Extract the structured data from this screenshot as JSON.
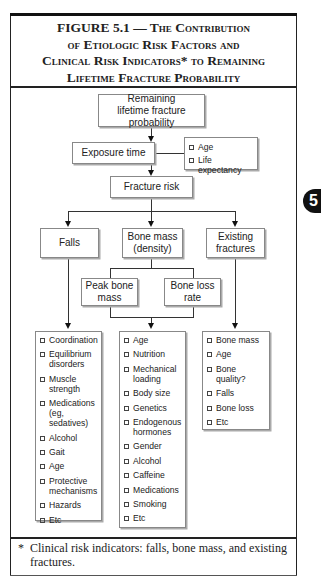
{
  "figure": {
    "title_lines": [
      "FIGURE 5.1 — The Contribution",
      "of Etiologic Risk Factors and",
      "Clinical Risk Indicators* to Remaining",
      "Lifetime Fracture Probability"
    ],
    "chapter_tab": "5"
  },
  "diagram": {
    "root": "Remaining lifetime fracture probability",
    "exposure": "Exposure time",
    "exposure_factors": [
      "Age",
      "Life expectancy"
    ],
    "fracture_risk": "Fracture risk",
    "branches": {
      "falls": "Falls",
      "bone_mass": "Bone mass (density)",
      "existing": "Existing fractures"
    },
    "bone_sub": {
      "peak": "Peak bone mass",
      "loss": "Bone loss rate"
    },
    "lists": {
      "falls": [
        "Coordination",
        "Equilibrium disorders",
        "Muscle strength",
        "Medications (eg, sedatives)",
        "Alcohol",
        "Gait",
        "Age",
        "Protective mechanisms",
        "Hazards",
        "Etc"
      ],
      "bone_mass": [
        "Age",
        "Nutrition",
        "Mechanical loading",
        "Body size",
        "Genetics",
        "Endogenous hormones",
        "Gender",
        "Alcohol",
        "Caffeine",
        "Medications",
        "Smoking",
        "Etc"
      ],
      "existing": [
        "Bone mass",
        "Age",
        "Bone quality?",
        "Falls",
        "Bone loss",
        "Etc"
      ]
    }
  },
  "footnote": {
    "marker": "*",
    "text": "Clinical risk indicators: falls, bone mass, and existing fractures."
  }
}
